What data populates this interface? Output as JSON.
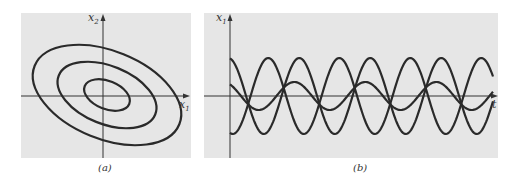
{
  "figure": {
    "panel_a": {
      "caption": "(a)",
      "x_axis_label": "x",
      "x_axis_sub": "1",
      "y_axis_label": "x",
      "y_axis_sub": "2",
      "description": "Phase portrait: three nested tilted ellipses around the origin"
    },
    "panel_b": {
      "caption": "(b)",
      "x_axis_label": "t",
      "y_axis_label": "x",
      "y_axis_sub": "1",
      "description": "Three oscillating solution curves versus time"
    },
    "colors": {
      "panel_bg": "#e6e6e6",
      "stroke": "#2a2a2a",
      "axis": "#333333"
    }
  },
  "chart_data": [
    {
      "type": "line",
      "title": "(a)",
      "xlabel": "x1",
      "ylabel": "x2",
      "series": [
        {
          "name": "inner orbit",
          "shape": "ellipse",
          "rx": 0.45,
          "ry": 0.3,
          "tilt_deg": 20
        },
        {
          "name": "middle orbit",
          "shape": "ellipse",
          "rx": 0.9,
          "ry": 0.55,
          "tilt_deg": 20
        },
        {
          "name": "outer orbit",
          "shape": "ellipse",
          "rx": 1.35,
          "ry": 0.8,
          "tilt_deg": 20
        }
      ],
      "grid": false
    },
    {
      "type": "line",
      "title": "(b)",
      "xlabel": "t",
      "ylabel": "x1",
      "series": [
        {
          "name": "solution 1",
          "amplitude": 1.0,
          "phase": "starts near max, decreasing"
        },
        {
          "name": "solution 2",
          "amplitude": 1.0,
          "phase": "starts near min, increasing"
        },
        {
          "name": "solution 3",
          "amplitude": 0.4,
          "phase": "starts slightly positive"
        }
      ],
      "periods_shown": 4,
      "grid": false
    }
  ]
}
